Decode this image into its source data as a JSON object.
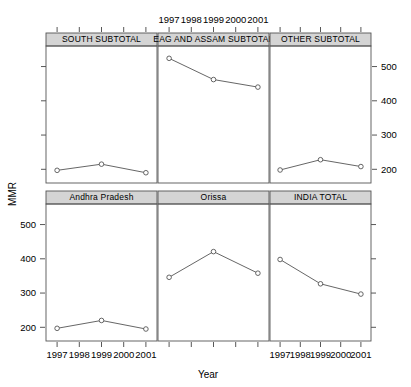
{
  "chart_data": {
    "type": "line",
    "title": "",
    "xlabel": "Year",
    "ylabel": "MMR",
    "layout": "trellis 3 columns x 2 rows",
    "x": [
      1997,
      1999,
      2001
    ],
    "xtick_labels": [
      "1997",
      "1998",
      "1999",
      "2000",
      "2001"
    ],
    "xticks": [
      1997,
      1998,
      1999,
      2000,
      2001
    ],
    "xlim": [
      1996.5,
      2001.5
    ],
    "ytick_labels": [
      "200",
      "300",
      "400",
      "500"
    ],
    "yticks": [
      200,
      300,
      400,
      500
    ],
    "ylim": [
      160,
      560
    ],
    "grid": false,
    "legend": "none",
    "marker": "open-circle",
    "panels": [
      {
        "label": "SOUTH SUBTOTAL",
        "row": 0,
        "col": 0,
        "values": [
          197,
          215,
          190
        ]
      },
      {
        "label": "EAG AND ASSAM SUBTOTAL",
        "row": 0,
        "col": 1,
        "values": [
          524,
          462,
          440
        ]
      },
      {
        "label": "OTHER SUBTOTAL",
        "row": 0,
        "col": 2,
        "values": [
          198,
          228,
          208
        ]
      },
      {
        "label": "Andhra Pradesh",
        "row": 1,
        "col": 0,
        "values": [
          197,
          220,
          195
        ]
      },
      {
        "label": "Orissa",
        "row": 1,
        "col": 1,
        "values": [
          346,
          421,
          358
        ]
      },
      {
        "label": "INDIA TOTAL",
        "row": 1,
        "col": 2,
        "values": [
          398,
          327,
          297
        ]
      }
    ]
  },
  "axes": {
    "ylabel": "MMR",
    "xlabel": "Year",
    "top_xlabels": [
      "1997",
      "1998",
      "1999",
      "2000",
      "2001"
    ],
    "bottom_left_xlabels": [
      "1997",
      "1998",
      "1999",
      "2000",
      "2001"
    ],
    "bottom_right_xlabels": [
      "1997",
      "1998",
      "1999",
      "2000",
      "2001"
    ],
    "right_ylabels": [
      "500",
      "400",
      "300",
      "200"
    ],
    "left_ylabels": [
      "500",
      "400",
      "300",
      "200"
    ]
  },
  "style": {
    "strip_fill": "#d4d4d4",
    "panel_border": "#555555",
    "line_color": "#555555",
    "marker_fill": "#ffffff",
    "background": "#ffffff"
  }
}
